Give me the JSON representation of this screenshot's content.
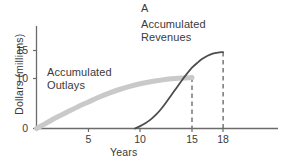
{
  "chart_data": {
    "type": "line",
    "title": "A",
    "xlabel": "Years",
    "ylabel": "Dollars (millions)",
    "xlim": [
      0,
      23.5
    ],
    "ylim": [
      0,
      17
    ],
    "xticks": [
      5,
      10,
      15,
      18
    ],
    "xtick_labels": [
      "5",
      "10",
      "15",
      "18"
    ],
    "yticks": [
      0,
      10,
      15
    ],
    "ytick_labels": [
      "0",
      "10",
      "15"
    ],
    "grid": false,
    "legend": "inline-annotations",
    "series": [
      {
        "name": "Accumulated Outlays",
        "color": "#c9c9c9",
        "line_width": 5,
        "style": "solid",
        "x": [
          0,
          1,
          2,
          3,
          4,
          5,
          6,
          7,
          8,
          9,
          10,
          11,
          12,
          13,
          14,
          15
        ],
        "values": [
          0,
          1.1,
          2.2,
          3.2,
          4.2,
          5.1,
          6.0,
          6.8,
          7.5,
          8.1,
          8.6,
          9.0,
          9.3,
          9.55,
          9.7,
          9.8
        ]
      },
      {
        "name": "Accumulated Revenues",
        "color": "#4d4d4d",
        "line_width": 1.8,
        "style": "solid",
        "x": [
          9.5,
          10,
          10.5,
          11,
          11.5,
          12,
          12.5,
          13,
          13.5,
          14,
          14.5,
          15,
          15.5,
          16,
          16.5,
          17,
          17.5,
          18
        ],
        "values": [
          0,
          0.45,
          1.0,
          1.7,
          2.6,
          3.7,
          5.0,
          6.4,
          7.8,
          9.2,
          10.5,
          11.7,
          12.6,
          13.4,
          14.0,
          14.4,
          14.6,
          14.7
        ]
      }
    ],
    "annotations": [
      {
        "name": "outlays-label",
        "text_line1": "Accumulated",
        "text_line2": "Outlays",
        "x": 1.2,
        "y": 11.5
      },
      {
        "name": "revenues-label",
        "text_line1": "Accumulated",
        "text_line2": "Revenues",
        "x": 10.2,
        "y": 16.2
      }
    ],
    "dropline_markers": [
      {
        "name": "outlays-end-dropline",
        "x": 15,
        "y_top": 9.8,
        "style": "dashed",
        "color": "#555555"
      },
      {
        "name": "revenues-end-dropline",
        "x": 18,
        "y_top": 14.7,
        "style": "dashed",
        "color": "#555555"
      }
    ]
  },
  "axis": {
    "x_title": "Years",
    "y_title": "Dollars (millions)"
  },
  "labels": {
    "title": "A",
    "outlays_line1": "Accumulated",
    "outlays_line2": "Outlays",
    "revenues_line1": "Accumulated",
    "revenues_line2": "Revenues"
  },
  "ticks": {
    "y": [
      "15",
      "10",
      "0"
    ],
    "x": [
      "5",
      "10",
      "15",
      "18"
    ]
  },
  "colors": {
    "outlays": "#c9c9c9",
    "revenues": "#4d4d4d",
    "axis": "#666666",
    "text": "#3a3a3a",
    "dashed": "#555555",
    "background": "#ffffff"
  }
}
